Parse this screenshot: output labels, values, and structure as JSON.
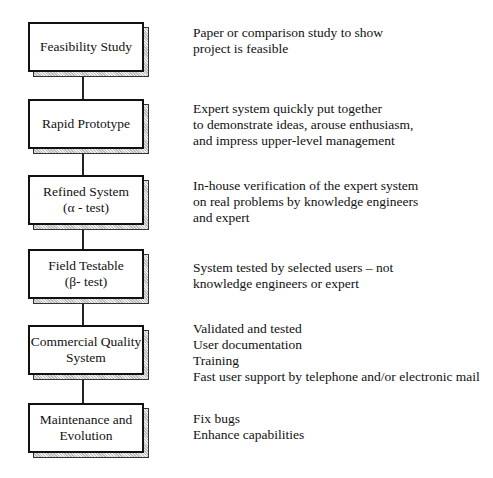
{
  "diagram": {
    "type": "vertical-flow",
    "stages": [
      {
        "id": "feasibility",
        "label_lines": [
          "Feasibility Study"
        ],
        "description_lines": [
          "Paper or comparison study to show",
          "project is feasible"
        ]
      },
      {
        "id": "rapid-prototype",
        "label_lines": [
          "Rapid Prototype"
        ],
        "description_lines": [
          "Expert system quickly put together",
          "to demonstrate ideas, arouse enthusiasm,",
          "and impress upper-level management"
        ]
      },
      {
        "id": "refined-system",
        "label_lines": [
          "Refined System",
          "(α - test)"
        ],
        "description_lines": [
          "In-house verification of the expert system",
          "on real problems by knowledge engineers",
          "and expert"
        ]
      },
      {
        "id": "field-testable",
        "label_lines": [
          "Field Testable",
          "(β- test)"
        ],
        "description_lines": [
          "System tested by selected users – not",
          "knowledge engineers or expert"
        ]
      },
      {
        "id": "commercial-quality",
        "label_lines": [
          "Commercial Quality",
          "System"
        ],
        "description_lines": [
          "Validated and tested",
          "User documentation",
          "Training",
          "Fast user support by telephone and/or electronic mail"
        ]
      },
      {
        "id": "maintenance",
        "label_lines": [
          "Maintenance and",
          "Evolution"
        ],
        "description_lines": [
          "Fix bugs",
          "Enhance capabilities"
        ]
      }
    ]
  }
}
